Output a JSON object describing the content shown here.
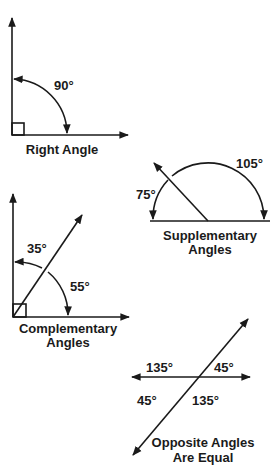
{
  "diagram": {
    "type": "geometry-angles",
    "panels": [
      {
        "id": "right",
        "caption": [
          "Right Angle"
        ],
        "angles": [
          {
            "label": "90°"
          }
        ]
      },
      {
        "id": "supplementary",
        "caption": [
          "Supplementary",
          "Angles"
        ],
        "angles": [
          {
            "label": "75°"
          },
          {
            "label": "105°"
          }
        ]
      },
      {
        "id": "complementary",
        "caption": [
          "Complementary",
          "Angles"
        ],
        "angles": [
          {
            "label": "35°"
          },
          {
            "label": "55°"
          }
        ]
      },
      {
        "id": "opposite",
        "caption": [
          "Opposite Angles",
          "Are Equal"
        ],
        "angles": [
          {
            "label": "135°"
          },
          {
            "label": "45°"
          },
          {
            "label": "45°"
          },
          {
            "label": "135°"
          }
        ]
      }
    ],
    "colors": {
      "ink": "#1a1a1a",
      "background": "#ffffff"
    }
  }
}
